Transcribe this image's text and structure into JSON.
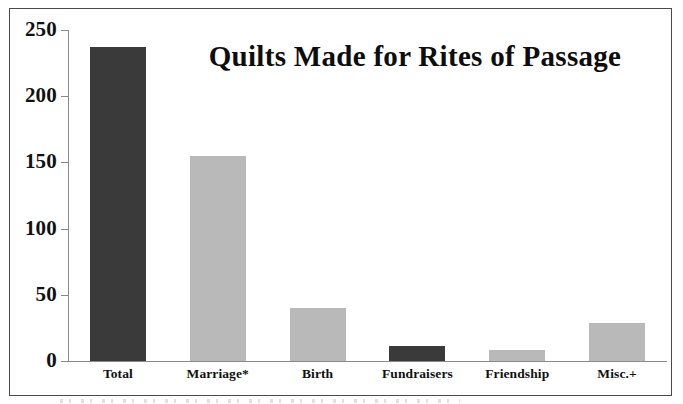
{
  "chart_data": {
    "type": "bar",
    "title": "Quilts Made for Rites of Passage",
    "xlabel": "",
    "ylabel": "",
    "categories": [
      "Total",
      "Marriage*",
      "Birth",
      "Fundraisers",
      "Friendship",
      "Misc.+"
    ],
    "values": [
      237,
      155,
      40,
      11,
      8,
      29
    ],
    "bar_colors": [
      "#3a3a3a",
      "#b9b9b9",
      "#b9b9b9",
      "#3a3a3a",
      "#b9b9b9",
      "#b9b9b9"
    ],
    "ylim": [
      0,
      250
    ],
    "yticks": [
      0,
      50,
      100,
      150,
      200,
      250
    ],
    "ytick_labels": [
      "0",
      "50",
      "100",
      "150",
      "200",
      "250"
    ],
    "grid": false,
    "legend": false,
    "legend_position": "none"
  },
  "figure": {
    "background": "#ffffff",
    "border_color": "#4a4a4a",
    "axis_color": "#8a8a8a",
    "text_color": "#111111",
    "accent_dark": "#3a3a3a",
    "accent_light": "#b9b9b9"
  }
}
